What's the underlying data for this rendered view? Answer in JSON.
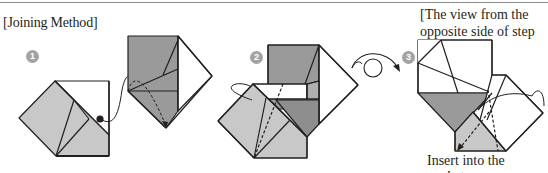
{
  "section": {
    "title": "[Joining Method]"
  },
  "steps": [
    {
      "number": "1"
    },
    {
      "number": "2"
    },
    {
      "number": "3"
    }
  ],
  "view_note": {
    "line1": "[The view from the",
    "line2_prefix": "opposite side of step ",
    "line2_step": "2",
    "line2_suffix": "]"
  },
  "caption": "Insert into the pocket.",
  "colors": {
    "light_gray": "#c8c8c8",
    "dark_gray": "#9a9a9a",
    "line": "#231f20",
    "badge": "#a3a3a3"
  }
}
